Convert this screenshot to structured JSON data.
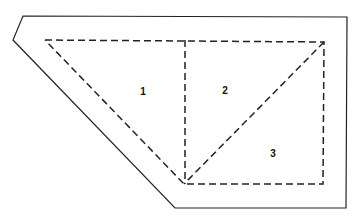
{
  "diagram": {
    "outer_boundary": {
      "style": "solid",
      "points": [
        [
          23,
          16
        ],
        [
          347,
          17
        ],
        [
          346,
          208
        ],
        [
          175,
          208
        ],
        [
          13,
          40
        ]
      ]
    },
    "inner_boundary": {
      "style": "dashed",
      "points": [
        [
          45,
          40
        ],
        [
          324,
          42
        ],
        [
          323,
          184
        ],
        [
          184,
          184
        ]
      ]
    },
    "dividers": [
      {
        "style": "dashed",
        "from": [
          185,
          40
        ],
        "to": [
          185,
          184
        ]
      },
      {
        "style": "dashed",
        "from": [
          324,
          42
        ],
        "to": [
          184,
          184
        ]
      }
    ],
    "regions": [
      {
        "label": "1",
        "x": 143,
        "y": 92
      },
      {
        "label": "2",
        "x": 225,
        "y": 91
      },
      {
        "label": "3",
        "x": 273,
        "y": 154
      }
    ],
    "colors": {
      "stroke": "#222222",
      "background": "#ffffff",
      "label": "#111111"
    }
  }
}
